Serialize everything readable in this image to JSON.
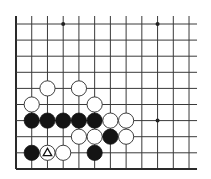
{
  "board": {
    "description": "Go board diagram, corner section (left and bottom edges shown)",
    "columns": 12,
    "rows": 10,
    "origin_x": 16,
    "origin_y": 24,
    "spacing_x": 15.73,
    "spacing_y": 16.1,
    "open_top_extend": 8,
    "open_right_extend": 8,
    "stone_radius": 7.6,
    "edges": [
      "left",
      "bottom"
    ],
    "colors": {
      "line": "#3a3a3a",
      "black_stone": "#141414",
      "white_stone": "#ffffff",
      "background": "#ffffff"
    },
    "star_points": [
      {
        "col": 3,
        "row": 0
      },
      {
        "col": 9,
        "row": 0
      },
      {
        "col": 9,
        "row": 6
      }
    ],
    "stones": [
      {
        "color": "white",
        "col": 2,
        "row": 4
      },
      {
        "color": "white",
        "col": 4,
        "row": 4
      },
      {
        "color": "white",
        "col": 1,
        "row": 5
      },
      {
        "color": "white",
        "col": 5,
        "row": 5
      },
      {
        "color": "black",
        "col": 1,
        "row": 6
      },
      {
        "color": "black",
        "col": 2,
        "row": 6
      },
      {
        "color": "black",
        "col": 3,
        "row": 6
      },
      {
        "color": "black",
        "col": 4,
        "row": 6
      },
      {
        "color": "black",
        "col": 5,
        "row": 6
      },
      {
        "color": "white",
        "col": 6,
        "row": 6
      },
      {
        "color": "white",
        "col": 7,
        "row": 6
      },
      {
        "color": "white",
        "col": 4,
        "row": 7
      },
      {
        "color": "white",
        "col": 5,
        "row": 7
      },
      {
        "color": "black",
        "col": 6,
        "row": 7
      },
      {
        "color": "white",
        "col": 7,
        "row": 7
      },
      {
        "color": "black",
        "col": 1,
        "row": 8
      },
      {
        "color": "white",
        "col": 2,
        "row": 8,
        "marker": "triangle"
      },
      {
        "color": "white",
        "col": 3,
        "row": 8
      },
      {
        "color": "black",
        "col": 5,
        "row": 8
      }
    ]
  }
}
